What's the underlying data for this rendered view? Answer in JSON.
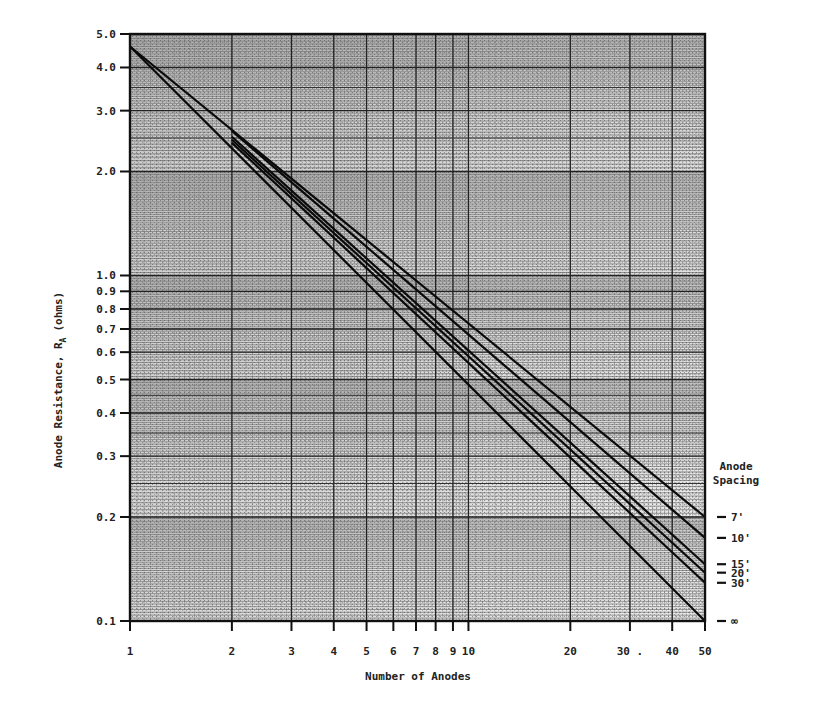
{
  "chart_data": {
    "type": "line",
    "title": "",
    "xlabel": "Number of Anodes",
    "ylabel": "Anode Resistance, R_A (ohms)",
    "x_scale": "log",
    "y_scale": "log",
    "xlim": [
      1,
      50
    ],
    "ylim": [
      0.1,
      5.0
    ],
    "grid": true,
    "x_ticks": [
      1,
      2,
      3,
      4,
      5,
      6,
      7,
      8,
      9,
      10,
      20,
      30,
      40,
      50
    ],
    "x_tick_labels": [
      "1",
      "2",
      "3",
      "4",
      "5",
      "6",
      "7",
      "8",
      "9",
      "10",
      "20",
      "30 .",
      "40",
      "50"
    ],
    "y_ticks": [
      0.1,
      0.2,
      0.3,
      0.4,
      0.5,
      0.6,
      0.7,
      0.8,
      0.9,
      1.0,
      2.0,
      3.0,
      4.0,
      5.0
    ],
    "y_tick_labels": [
      "0.1",
      "0.2",
      "0.3",
      "0.4",
      "0.5",
      "0.6",
      "0.7",
      "0.8",
      "0.9",
      "1.0",
      "2.0",
      "3.0",
      "4.0",
      "5.0"
    ],
    "legend_title": [
      "Anode",
      "Spacing"
    ],
    "legend_position": "right",
    "series": [
      {
        "name": "7'",
        "x": [
          1,
          50
        ],
        "y": [
          4.6,
          0.2
        ]
      },
      {
        "name": "10'",
        "x": [
          2,
          50
        ],
        "y": [
          2.62,
          0.174
        ]
      },
      {
        "name": "15'",
        "x": [
          2,
          50
        ],
        "y": [
          2.52,
          0.146
        ]
      },
      {
        "name": "20'",
        "x": [
          2,
          50
        ],
        "y": [
          2.47,
          0.138
        ]
      },
      {
        "name": "30'",
        "x": [
          2,
          50
        ],
        "y": [
          2.42,
          0.129
        ]
      },
      {
        "name": "∞",
        "x": [
          1,
          50
        ],
        "y": [
          4.6,
          0.1
        ]
      }
    ]
  },
  "labels": {
    "xlabel": "Number of Anodes",
    "ylabel_main": "Anode Resistance, R",
    "ylabel_sub": "A",
    "ylabel_units": "(ohms)",
    "legend_title_1": "Anode",
    "legend_title_2": "Spacing"
  }
}
